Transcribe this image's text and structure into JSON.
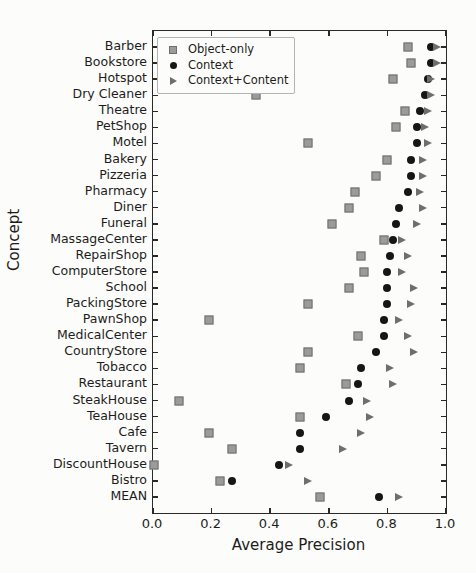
{
  "chart_data": {
    "type": "scatter",
    "orientation": "horizontal",
    "xlabel": "Average Precision",
    "ylabel": "Concept",
    "xlim": [
      0.0,
      1.0
    ],
    "x_ticks": [
      0.0,
      0.2,
      0.4,
      0.6,
      0.8,
      1.0
    ],
    "x_tick_labels": [
      "0.0",
      "0.2",
      "0.4",
      "0.6",
      "0.8",
      "1.0"
    ],
    "grid": false,
    "legend_position": "upper-left",
    "categories": [
      "Barber",
      "Bookstore",
      "Hotspot",
      "Dry Cleaner",
      "Theatre",
      "PetShop",
      "Motel",
      "Bakery",
      "Pizzeria",
      "Pharmacy",
      "Diner",
      "Funeral",
      "MassageCenter",
      "RepairShop",
      "ComputerStore",
      "School",
      "PackingStore",
      "PawnShop",
      "MedicalCenter",
      "CountryStore",
      "Tobacco",
      "Restaurant",
      "SteakHouse",
      "TeaHouse",
      "Cafe",
      "Tavern",
      "DiscountHouse",
      "Bistro",
      "MEAN"
    ],
    "series": [
      {
        "name": "Object-only",
        "marker": "square",
        "color": "#9b9b9b",
        "values": [
          0.87,
          0.88,
          0.82,
          0.35,
          0.86,
          0.83,
          0.53,
          0.8,
          0.76,
          0.69,
          0.67,
          0.61,
          0.79,
          0.71,
          0.72,
          0.67,
          0.53,
          0.19,
          0.7,
          0.53,
          0.5,
          0.66,
          0.09,
          0.5,
          0.19,
          0.27,
          0.005,
          0.23,
          0.57
        ]
      },
      {
        "name": "Context",
        "marker": "circle",
        "color": "#161616",
        "values": [
          0.95,
          0.95,
          0.94,
          0.93,
          0.91,
          0.9,
          0.9,
          0.88,
          0.88,
          0.87,
          0.84,
          0.83,
          0.82,
          0.81,
          0.8,
          0.8,
          0.8,
          0.79,
          0.79,
          0.76,
          0.71,
          0.7,
          0.67,
          0.59,
          0.5,
          0.5,
          0.43,
          0.27,
          0.77
        ]
      },
      {
        "name": "Context+Content",
        "marker": "triangle",
        "color": "#6e6e6e",
        "values": [
          0.97,
          0.97,
          0.95,
          0.95,
          0.94,
          0.93,
          0.94,
          0.92,
          0.92,
          0.91,
          0.92,
          0.9,
          0.85,
          0.87,
          0.85,
          0.89,
          0.88,
          0.84,
          0.87,
          0.89,
          0.81,
          0.82,
          0.73,
          0.74,
          0.71,
          0.65,
          0.465,
          0.53,
          0.84
        ]
      }
    ],
    "styles": {
      "background": "#fcfcfa",
      "axis_color": "#2a2a2a",
      "text_color": "#1c1c1c",
      "legend_border": "#b3b3b3"
    }
  }
}
